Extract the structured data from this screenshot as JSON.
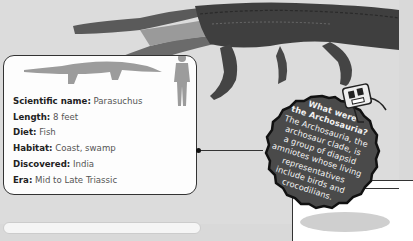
{
  "creature": {
    "image_alt": "Parasuchus illustration",
    "silhouette_alt": "Parasuchus size silhouette",
    "human_alt": "Human size comparison silhouette"
  },
  "facts": [
    {
      "label": "Scientific name:",
      "value": "Parasuchus"
    },
    {
      "label": "Length:",
      "value": "8 feet"
    },
    {
      "label": "Diet:",
      "value": "Fish"
    },
    {
      "label": "Habitat:",
      "value": "Coast, swamp"
    },
    {
      "label": "Discovered:",
      "value": "India"
    },
    {
      "label": "Era:",
      "value": "Mid to Late Triassic"
    }
  ],
  "bubble": {
    "lines": [
      "What were",
      "the Archosauria?",
      "The Archosauria, the",
      "archosaur clade, is",
      "a group of diapsid",
      "amniotes whose living",
      "representatives",
      "include birds and",
      "crocodilians."
    ]
  },
  "colors": {
    "background": "#dcdcdc",
    "box_fill": "#fdfdfd",
    "border": "#333333",
    "bubble_fill": "#4a4a4a",
    "bubble_text": "#f2f2f2"
  }
}
